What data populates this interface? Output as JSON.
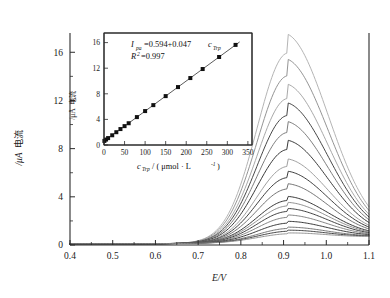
{
  "figure": {
    "background": "#ffffff",
    "axis_color": "#2b2b2b"
  },
  "main_axes": {
    "xlabel": "E/V",
    "ylabel_cjk": "电流",
    "ylabel_unit": "/μA",
    "x_ticks": [
      "0.4",
      "0.5",
      "0.6",
      "0.7",
      "0.8",
      "0.9",
      "1.0",
      "1.1"
    ],
    "y_ticks": [
      "0",
      "4",
      "8",
      "12",
      "16"
    ]
  },
  "inset_axes": {
    "xlabel_var": "c",
    "xlabel_sub": "Trp",
    "xlabel_unit": " / ( μmol · L",
    "xlabel_exp": "-1",
    "xlabel_close": " )",
    "ylabel_cjk": "电流",
    "ylabel_unit": "/μA",
    "x_ticks": [
      "0",
      "50",
      "100",
      "150",
      "200",
      "250",
      "300",
      "350"
    ],
    "y_ticks": [
      "0",
      "4",
      "8",
      "12",
      "16"
    ],
    "equation": {
      "lhs_var": "I",
      "lhs_sub": "pa",
      "rhs": "=0.594+0.047 ",
      "rhs_var": "c",
      "rhs_sub": "Trp",
      "r2_var": "R",
      "r2_sup": "2",
      "r2_val": "=0.997"
    }
  },
  "chart_data": {
    "type": "line",
    "title": "",
    "xlabel": "E/V",
    "ylabel": "电流/μA",
    "xlim": [
      0.4,
      1.1
    ],
    "ylim": [
      0,
      17.6
    ],
    "grid": false,
    "legend": "none",
    "peak_potential_V": 0.91,
    "series": [
      {
        "name": "c = 1 μmol/L",
        "peak_current_uA": 0.64,
        "color": "#8f8f8f"
      },
      {
        "name": "c = 5 μmol/L",
        "peak_current_uA": 0.85,
        "color": "#3a3a3a"
      },
      {
        "name": "c = 10 μmol/L",
        "peak_current_uA": 1.08,
        "color": "#6e6e6e"
      },
      {
        "name": "c = 20 μmol/L",
        "peak_current_uA": 1.52,
        "color": "#2f2f2f"
      },
      {
        "name": "c = 30 μmol/L",
        "peak_current_uA": 2.0,
        "color": "#7c7c7c"
      },
      {
        "name": "c = 40 μmol/L",
        "peak_current_uA": 2.49,
        "color": "#373737"
      },
      {
        "name": "c = 50 μmol/L",
        "peak_current_uA": 2.95,
        "color": "#8a8a8a"
      },
      {
        "name": "c = 60 μmol/L",
        "peak_current_uA": 3.4,
        "color": "#2c2c2c"
      },
      {
        "name": "c = 80 μmol/L",
        "peak_current_uA": 4.36,
        "color": "#6b6b6b"
      },
      {
        "name": "c = 100 μmol/L",
        "peak_current_uA": 5.3,
        "color": "#333333"
      },
      {
        "name": "c = 120 μmol/L",
        "peak_current_uA": 6.23,
        "color": "#9a9a9a"
      },
      {
        "name": "c = 150 μmol/L",
        "peak_current_uA": 7.64,
        "color": "#2e2e2e"
      },
      {
        "name": "c = 180 μmol/L",
        "peak_current_uA": 9.05,
        "color": "#767676"
      },
      {
        "name": "c = 210 μmol/L",
        "peak_current_uA": 10.46,
        "color": "#3d3d3d"
      },
      {
        "name": "c = 240 μmol/L",
        "peak_current_uA": 11.87,
        "color": "#a3a3a3"
      },
      {
        "name": "c = 280 μmol/L",
        "peak_current_uA": 13.75,
        "color": "#8e8e8e"
      },
      {
        "name": "c = 320 μmol/L",
        "peak_current_uA": 15.64,
        "color": "#b0b0b0"
      }
    ],
    "inset": {
      "type": "scatter",
      "title": "",
      "xlabel": "c_Trp / (μmol · L-1)",
      "ylabel": "电流/μA",
      "xlim": [
        0,
        360
      ],
      "ylim": [
        0,
        17.5
      ],
      "grid": false,
      "fit_slope": 0.047,
      "fit_intercept": 0.594,
      "r_squared": 0.997,
      "x": [
        1,
        5,
        10,
        20,
        30,
        40,
        50,
        60,
        80,
        100,
        120,
        150,
        180,
        210,
        240,
        280,
        320
      ],
      "y": [
        0.64,
        0.85,
        1.08,
        1.52,
        2.0,
        2.49,
        2.95,
        3.4,
        4.36,
        5.3,
        6.23,
        7.64,
        9.05,
        10.46,
        11.87,
        13.75,
        15.64
      ]
    }
  }
}
